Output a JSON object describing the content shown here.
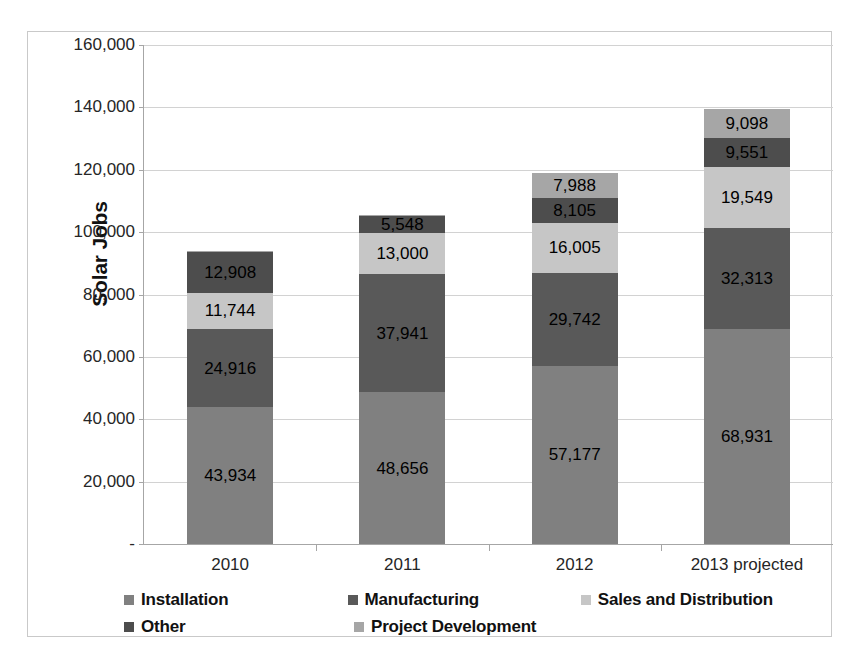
{
  "chart_data": {
    "type": "bar",
    "stacked": true,
    "title": "",
    "xlabel": "",
    "ylabel": "Solar Jobs",
    "categories": [
      "2010",
      "2011",
      "2012",
      "2013 projected"
    ],
    "ylim": [
      0,
      160000
    ],
    "yticks": [
      0,
      20000,
      40000,
      60000,
      80000,
      100000,
      120000,
      140000,
      160000
    ],
    "ytick_labels": [
      "-",
      "20,000",
      "40,000",
      "60,000",
      "80,000",
      "100,000",
      "120,000",
      "140,000",
      "160,000"
    ],
    "grid": true,
    "legend_position": "bottom",
    "series": [
      {
        "name": "Installation",
        "color": "#808080",
        "values": [
          43934,
          48656,
          57177,
          68931
        ],
        "labels": [
          "43,934",
          "48,656",
          "57,177",
          "68,931"
        ]
      },
      {
        "name": "Manufacturing",
        "color": "#595959",
        "values": [
          24916,
          37941,
          29742,
          32313
        ],
        "labels": [
          "24,916",
          "37,941",
          "29,742",
          "32,313"
        ]
      },
      {
        "name": "Sales and Distribution",
        "color": "#c6c6c6",
        "values": [
          11744,
          13000,
          16005,
          19549
        ],
        "labels": [
          "11,744",
          "13,000",
          "16,005",
          "19,549"
        ]
      },
      {
        "name": "Other",
        "color": "#4d4d4d",
        "values": [
          12908,
          5548,
          8105,
          9551
        ],
        "labels": [
          "12,908",
          "5,548",
          "8,105",
          "9,551"
        ]
      },
      {
        "name": "Project Development",
        "color": "#a6a6a6",
        "values": [
          600,
          400,
          7988,
          9098
        ],
        "labels": [
          "",
          "",
          "7,988",
          "9,098"
        ]
      }
    ],
    "totals": [
      93502,
      104745,
      118617,
      139442
    ]
  },
  "legend": {
    "rows": [
      [
        {
          "name": "Installation",
          "color": "#808080"
        },
        {
          "name": "Manufacturing",
          "color": "#595959"
        },
        {
          "name": "Sales and Distribution",
          "color": "#c6c6c6"
        }
      ],
      [
        {
          "name": "Other",
          "color": "#4d4d4d"
        },
        {
          "name": "Project Development",
          "color": "#a6a6a6"
        }
      ]
    ]
  }
}
